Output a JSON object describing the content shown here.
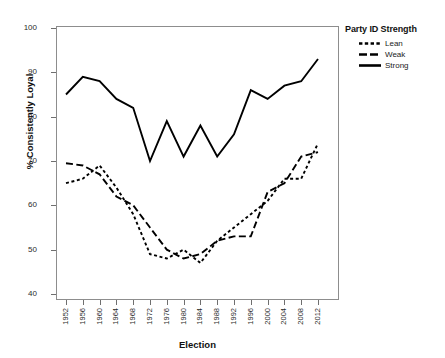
{
  "chart_data": {
    "type": "line",
    "title": "",
    "xlabel": "Election",
    "ylabel": "% Consistently Loyal",
    "categories": [
      "1952",
      "1956",
      "1960",
      "1964",
      "1968",
      "1972",
      "1976",
      "1980",
      "1984",
      "1988",
      "1992",
      "1996",
      "2000",
      "2004",
      "2008",
      "2012"
    ],
    "ylim": [
      40,
      100
    ],
    "yticks": [
      40,
      50,
      60,
      70,
      80,
      90,
      100
    ],
    "grid": false,
    "legend_position": "right",
    "legend_title": "Party ID Strength",
    "series": [
      {
        "name": "Lean",
        "style": "dotted",
        "color": "#000000",
        "values": [
          65,
          66,
          69,
          64,
          58,
          49,
          48,
          50,
          47,
          52,
          55,
          58,
          61,
          66,
          66,
          74
        ]
      },
      {
        "name": "Weak",
        "style": "dashed",
        "color": "#000000",
        "values": [
          69.5,
          69,
          67,
          62,
          60,
          55,
          50,
          48,
          49,
          52,
          53,
          53,
          63,
          65,
          71,
          72
        ]
      },
      {
        "name": "Strong",
        "style": "solid",
        "color": "#000000",
        "values": [
          85,
          89,
          88,
          84,
          82,
          70,
          79,
          71,
          78,
          71,
          76,
          86,
          84,
          87,
          88,
          93
        ]
      }
    ]
  },
  "axes": {
    "y_axis_title": "% Consistently Loyal",
    "x_axis_title": "Election"
  },
  "legend": {
    "title": "Party ID Strength",
    "entries": [
      {
        "label": "Lean",
        "swatch": "dotted-line-swatch"
      },
      {
        "label": "Weak",
        "swatch": "dashed-line-swatch"
      },
      {
        "label": "Strong",
        "swatch": "solid-line-swatch"
      }
    ]
  }
}
